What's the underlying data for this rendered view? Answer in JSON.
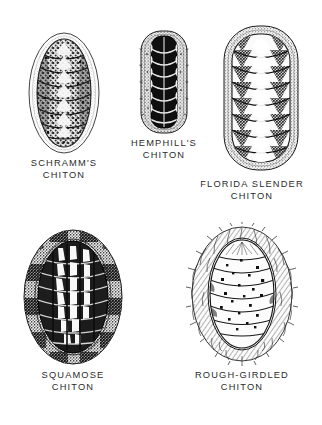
{
  "plate": {
    "title": "Chitons",
    "background_color": "#ffffff",
    "ink_color": "#1c1c1c",
    "caption_color": "#2b2b2b"
  },
  "specimens": [
    {
      "id": "schramms-chiton",
      "common_name": "SCHRAMM'S CHITON",
      "caption_lines": [
        "SCHRAMM'S",
        "CHITON"
      ],
      "valve_count": 8,
      "girdle_style": "wide-pale-smooth",
      "valve_style": "mottled-speckled",
      "body_shape": "broad-oval",
      "position": {
        "x": 22,
        "y": 32,
        "width": 84,
        "height": 122
      },
      "caption_position": {
        "x": 10,
        "y": 157,
        "width": 108
      }
    },
    {
      "id": "hemphills-chiton",
      "common_name": "HEMPHILL'S CHITON",
      "caption_lines": [
        "HEMPHILL'S",
        "CHITON"
      ],
      "valve_count": 8,
      "girdle_style": "narrow-speckled",
      "valve_style": "dark-solid-scalloped",
      "body_shape": "narrow-elongate",
      "position": {
        "x": 138,
        "y": 28,
        "width": 52,
        "height": 108
      },
      "caption_position": {
        "x": 116,
        "y": 137,
        "width": 96
      }
    },
    {
      "id": "florida-slender-chiton",
      "common_name": "FLORIDA SLENDER CHITON",
      "caption_lines": [
        "FLORIDA SLENDER",
        "CHITON"
      ],
      "valve_count": 8,
      "girdle_style": "medium-stippled",
      "valve_style": "white-center-dark-lateral",
      "body_shape": "elongate-oval",
      "position": {
        "x": 222,
        "y": 22,
        "width": 78,
        "height": 152
      },
      "caption_position": {
        "x": 186,
        "y": 178,
        "width": 132
      }
    },
    {
      "id": "squamose-chiton",
      "common_name": "SQUAMOSE CHITON",
      "caption_lines": [
        "SQUAMOSE",
        "CHITON"
      ],
      "valve_count": 8,
      "girdle_style": "checkered-stippled",
      "valve_style": "dark-with-white-blotches",
      "body_shape": "broad-oval",
      "position": {
        "x": 22,
        "y": 228,
        "width": 102,
        "height": 138
      },
      "caption_position": {
        "x": 24,
        "y": 369,
        "width": 98
      }
    },
    {
      "id": "rough-girdled-chiton",
      "common_name": "ROUGH-GIRDLED CHITON",
      "caption_lines": [
        "ROUGH-GIRDLED",
        "CHITON"
      ],
      "valve_count": 8,
      "girdle_style": "spiny-bristled",
      "valve_style": "white-with-dark-spots",
      "body_shape": "oval",
      "position": {
        "x": 186,
        "y": 222,
        "width": 112,
        "height": 144
      },
      "caption_position": {
        "x": 176,
        "y": 369,
        "width": 132
      }
    }
  ]
}
